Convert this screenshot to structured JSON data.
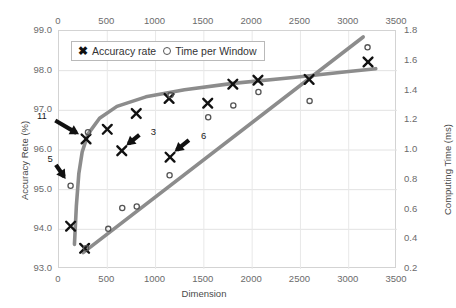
{
  "chart_data": {
    "type": "scatter",
    "title": "",
    "xlabel": "Dimension",
    "ylabel": "Accuracy Rete (%)",
    "y2label": "Computing Time (ms)",
    "xlim": [
      0,
      3500
    ],
    "ylim": [
      93.0,
      99.0
    ],
    "y2lim": [
      0.2,
      1.8
    ],
    "grid": true,
    "legend_position": "top-left-inside",
    "x_ticks": [
      "0",
      "500",
      "1000",
      "1500",
      "2000",
      "2500",
      "3000",
      "3500"
    ],
    "x_tick_values": [
      0,
      500,
      1000,
      1500,
      2000,
      2500,
      3000,
      3500
    ],
    "x_axis_top_duplicate": true,
    "y_ticks": [
      "93.0",
      "94.0",
      "95.0",
      "96.0",
      "97.0",
      "98.0",
      "99.0"
    ],
    "y_tick_values": [
      93.0,
      94.0,
      95.0,
      96.0,
      97.0,
      98.0,
      99.0
    ],
    "y2_ticks": [
      "0.2",
      "0.4",
      "0.6",
      "0.8",
      "1.0",
      "1.2",
      "1.4",
      "1.6",
      "1.8"
    ],
    "y2_tick_values": [
      0.2,
      0.4,
      0.6,
      0.8,
      1.0,
      1.2,
      1.4,
      1.6,
      1.8
    ],
    "series": [
      {
        "name": "Accuracy rate",
        "marker": "x",
        "axis": "left",
        "color": "#111111",
        "points": [
          {
            "x": 120,
            "y": 94.08
          },
          {
            "x": 265,
            "y": 93.52
          },
          {
            "x": 280,
            "y": 96.28
          },
          {
            "x": 500,
            "y": 96.52
          },
          {
            "x": 650,
            "y": 95.98
          },
          {
            "x": 800,
            "y": 96.92
          },
          {
            "x": 1140,
            "y": 97.3
          },
          {
            "x": 1150,
            "y": 95.82
          },
          {
            "x": 1540,
            "y": 97.18
          },
          {
            "x": 1800,
            "y": 97.66
          },
          {
            "x": 2060,
            "y": 97.76
          },
          {
            "x": 2590,
            "y": 97.78
          },
          {
            "x": 3200,
            "y": 98.22
          }
        ]
      },
      {
        "name": "Time per Window",
        "marker": "o",
        "axis": "right",
        "color": "#555555",
        "points": [
          {
            "x": 120,
            "y": 0.76
          },
          {
            "x": 280,
            "y": 0.34
          },
          {
            "x": 300,
            "y": 1.12
          },
          {
            "x": 510,
            "y": 0.47
          },
          {
            "x": 655,
            "y": 0.61
          },
          {
            "x": 805,
            "y": 0.62
          },
          {
            "x": 1145,
            "y": 0.83
          },
          {
            "x": 1155,
            "y": 1.37
          },
          {
            "x": 1545,
            "y": 1.22
          },
          {
            "x": 1805,
            "y": 1.3
          },
          {
            "x": 2065,
            "y": 1.39
          },
          {
            "x": 2595,
            "y": 1.33
          },
          {
            "x": 3195,
            "y": 1.69
          }
        ]
      }
    ],
    "trend_lines": [
      {
        "name": "accuracy-trend",
        "color": "#8c8c8c",
        "axis": "left",
        "path": [
          {
            "x": 160,
            "y": 93.62
          },
          {
            "x": 180,
            "y": 94.6
          },
          {
            "x": 205,
            "y": 95.4
          },
          {
            "x": 240,
            "y": 95.95
          },
          {
            "x": 300,
            "y": 96.4
          },
          {
            "x": 420,
            "y": 96.8
          },
          {
            "x": 600,
            "y": 97.1
          },
          {
            "x": 900,
            "y": 97.34
          },
          {
            "x": 1300,
            "y": 97.52
          },
          {
            "x": 1800,
            "y": 97.68
          },
          {
            "x": 2400,
            "y": 97.82
          },
          {
            "x": 3000,
            "y": 97.98
          },
          {
            "x": 3280,
            "y": 98.05
          }
        ]
      },
      {
        "name": "time-trend",
        "color": "#8c8c8c",
        "axis": "right",
        "path": [
          {
            "x": 250,
            "y": 0.31
          },
          {
            "x": 3150,
            "y": 1.76
          }
        ]
      }
    ],
    "annotations": [
      {
        "text": "11",
        "x": 280,
        "y": 96.28,
        "label_dx": -48,
        "label_dy": -28
      },
      {
        "text": "5",
        "x": 120,
        "y": 0.76,
        "axis": "right",
        "label_dx": -22,
        "label_dy": -32
      },
      {
        "text": "3",
        "x": 650,
        "y": 95.98,
        "label_dx": 30,
        "label_dy": -24
      },
      {
        "text": "6",
        "x": 1150,
        "y": 95.82,
        "label_dx": 32,
        "label_dy": -26
      }
    ]
  },
  "legend": {
    "items": [
      {
        "label": "Accuracy rate",
        "marker": "x"
      },
      {
        "label": "Time per Window",
        "marker": "o"
      }
    ]
  }
}
